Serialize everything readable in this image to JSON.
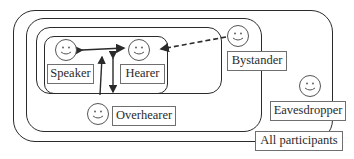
{
  "diagram": {
    "regions": [
      {
        "id": "all-participants",
        "label": "All participants"
      },
      {
        "id": "overhearer-region",
        "label": "Overhearer"
      },
      {
        "id": "bystander-region",
        "label": "Bystander"
      },
      {
        "id": "ratified-region",
        "label": "Speaker & Hearer"
      }
    ],
    "nodes": [
      {
        "id": "speaker",
        "label": "Speaker",
        "icon": "smiley-face-icon"
      },
      {
        "id": "hearer",
        "label": "Hearer",
        "icon": "smiley-face-icon"
      },
      {
        "id": "bystander",
        "label": "Bystander",
        "icon": "smiley-face-icon"
      },
      {
        "id": "overhearer",
        "label": "Overhearer",
        "icon": "smiley-face-icon"
      },
      {
        "id": "eavesdropper",
        "label": "Eavesdropper",
        "icon": "smiley-face-icon"
      }
    ],
    "edges": [
      {
        "from": "speaker",
        "to": "hearer",
        "style": "solid",
        "direction": "both"
      },
      {
        "from": "bystander",
        "to": "hearer",
        "style": "dashed",
        "direction": "to"
      },
      {
        "from": "overhearer",
        "to": "speaker-hearer-link",
        "style": "solid",
        "direction": "to"
      },
      {
        "from": "speaker-hearer-link",
        "to": "overhearer",
        "style": "solid",
        "direction": "both"
      }
    ],
    "labels": {
      "speaker": "Speaker",
      "hearer": "Hearer",
      "bystander": "Bystander",
      "overhearer": "Overhearer",
      "eavesdropper": "Eavesdropper",
      "all": "All participants"
    },
    "colors": {
      "line": "#2a2a2a",
      "label_border": "#6f6f6f",
      "background": "#ffffff"
    }
  }
}
